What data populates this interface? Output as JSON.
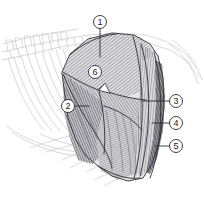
{
  "figure": {
    "type": "anatomical-line-illustration",
    "background_color": "#ffffff",
    "ink_color": "#2b2b2b",
    "faint_skeleton_color": "#cfcfd3",
    "width": 204,
    "height": 209
  },
  "callouts": [
    {
      "id": "callout-1",
      "label": "1",
      "cx": 100,
      "cy": 22,
      "r": 6.5,
      "leader": {
        "x1": 100,
        "y1": 28.5,
        "x2": 100,
        "y2": 57
      }
    },
    {
      "id": "callout-2",
      "label": "2",
      "cx": 68,
      "cy": 106,
      "r": 6.5,
      "leader": {
        "x1": 74.5,
        "y1": 106,
        "x2": 89,
        "y2": 106
      }
    },
    {
      "id": "callout-3",
      "label": "3",
      "cx": 176,
      "cy": 101,
      "r": 6.5,
      "leader": {
        "x1": 169.5,
        "y1": 101,
        "x2": 142,
        "y2": 101
      }
    },
    {
      "id": "callout-4",
      "label": "4",
      "cx": 176,
      "cy": 123,
      "r": 6.5,
      "leader": {
        "x1": 169.5,
        "y1": 123,
        "x2": 152,
        "y2": 123
      }
    },
    {
      "id": "callout-5",
      "label": "5",
      "cx": 176,
      "cy": 146,
      "r": 6.5,
      "leader": {
        "x1": 169.5,
        "y1": 146,
        "x2": 155,
        "y2": 146
      }
    },
    {
      "id": "callout-6",
      "label": "6",
      "cx": 95,
      "cy": 72,
      "r": 6.5,
      "leader": null
    }
  ],
  "regions": [
    {
      "id": "region-upper-dorsal",
      "callout": "1",
      "hatch": "diagonal-down-right",
      "tone": "#d8d8dc"
    },
    {
      "id": "region-cranial-shoulder",
      "callout": "2",
      "hatch": "fan-radiating",
      "tone": "#b9b9be"
    },
    {
      "id": "region-caudal-band",
      "callout": "3",
      "hatch": "vertical",
      "tone": "#c9c9ce"
    },
    {
      "id": "region-lateral-sheet",
      "callout": "4",
      "hatch": "vertical-fine",
      "tone": "#d2d2d6"
    },
    {
      "id": "region-caudal-edge",
      "callout": "5",
      "hatch": "dense-edge",
      "tone": "#8f8f95"
    },
    {
      "id": "region-mid-belly",
      "callout": "6",
      "hatch": "diagonal-down-left",
      "tone": "#c4c4c9"
    }
  ]
}
